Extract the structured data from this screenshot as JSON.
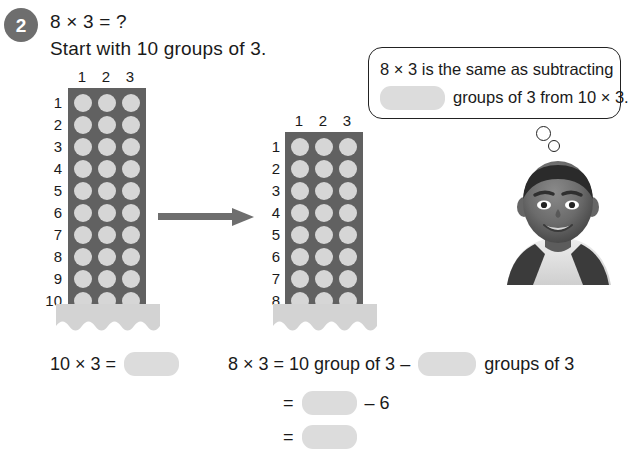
{
  "question": {
    "number": "2",
    "line1": "8 × 3 = ?",
    "line2": "Start with 10 groups of 3."
  },
  "left_array": {
    "label": "10 groups of 3",
    "rows": 10,
    "cols": 3,
    "row_labels": [
      "1",
      "2",
      "3",
      "4",
      "5",
      "6",
      "7",
      "8",
      "9",
      "10"
    ],
    "col_labels": [
      "1",
      "2",
      "3"
    ],
    "dot_color": "#d6d6d6",
    "panel_color": "#616161",
    "base_color": "#d3d3d3"
  },
  "right_array": {
    "label": "8 groups of 3",
    "rows": 8,
    "cols": 3,
    "row_labels": [
      "1",
      "2",
      "3",
      "4",
      "5",
      "6",
      "7",
      "8"
    ],
    "col_labels": [
      "1",
      "2",
      "3"
    ],
    "dot_color": "#d6d6d6",
    "panel_color": "#616161",
    "base_color": "#d3d3d3"
  },
  "arrow": {
    "direction": "right",
    "color": "#6e6e6e"
  },
  "speech_bubble": {
    "line1": "8 × 3 is the same as subtracting",
    "line2": "groups of 3 from 10 × 3.",
    "blank_answer": "",
    "border_color": "#222222"
  },
  "character": {
    "description": "smiling boy"
  },
  "equations": {
    "eq1_left": "10 × 3 =",
    "eq1_blank": "",
    "eq2_left": "8 × 3 = 10 group of 3 –",
    "eq2_blank": "",
    "eq2_right": "groups of 3",
    "eq3_sign": "=",
    "eq3_blank": "",
    "eq3_right": "– 6",
    "eq4_sign": "=",
    "eq4_blank": ""
  }
}
